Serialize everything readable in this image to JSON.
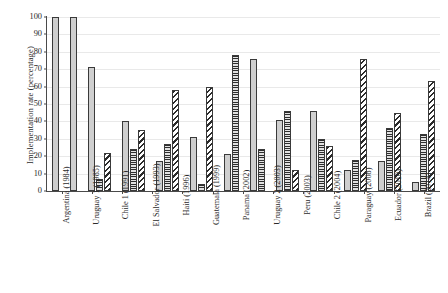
{
  "chart_data": {
    "type": "bar",
    "title": "",
    "xlabel": "",
    "ylabel": "Implementation rate (percentage)",
    "ylim": [
      0,
      100
    ],
    "yticks": [
      0,
      10,
      20,
      30,
      40,
      50,
      60,
      70,
      80,
      90,
      100
    ],
    "grid": true,
    "legend": "none-visible",
    "categories": [
      "Argentina (1984)",
      "Uruguay 1 (1985)",
      "Chile 1 (1991)",
      "El Salvador (1993)",
      "Haiti (1996)",
      "Guatemala (1999)",
      "Panama (2002)",
      "Uruguay 2 (2003)",
      "Peru (2003)",
      "Chile 2 (2004)",
      "Paraguay (2008)",
      "Ecuador (2010)",
      "Brazil (2014)"
    ],
    "series": [
      {
        "name": "series-1",
        "pattern": "dotted",
        "values": [
          100,
          100,
          71,
          40,
          17,
          31,
          21,
          76,
          41,
          46,
          12,
          17,
          5
        ]
      },
      {
        "name": "series-2",
        "pattern": "horizontal-lines",
        "values": [
          null,
          null,
          7,
          24,
          27,
          4,
          78,
          24,
          46,
          30,
          18,
          36,
          33
        ]
      },
      {
        "name": "series-3",
        "pattern": "diagonal-hatch",
        "values": [
          null,
          null,
          22,
          35,
          58,
          60,
          null,
          null,
          12,
          26,
          76,
          45,
          63
        ]
      }
    ]
  },
  "axis": {
    "y_title": "Implementation rate (percentage)"
  }
}
